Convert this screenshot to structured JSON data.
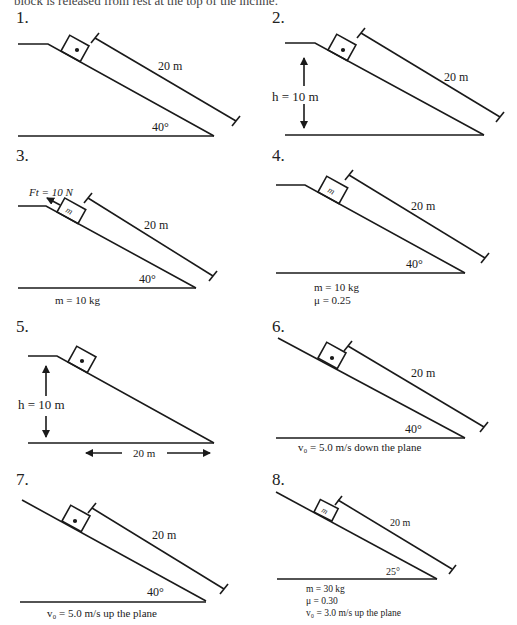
{
  "header": {
    "clipped_text": "block is released from rest at the top of the incline."
  },
  "problems": [
    {
      "number": "1.",
      "length_label": "20 m",
      "angle_label": "40°"
    },
    {
      "number": "2.",
      "length_label": "20 m",
      "height_label": "h = 10 m"
    },
    {
      "number": "3.",
      "length_label": "20 m",
      "angle_label": "40°",
      "force_label": "Ft = 10 N",
      "block_label": "m",
      "info": [
        "m = 10 kg"
      ]
    },
    {
      "number": "4.",
      "length_label": "20 m",
      "angle_label": "40°",
      "block_label": "m",
      "info": [
        "m = 10 kg",
        "μ = 0.25"
      ]
    },
    {
      "number": "5.",
      "height_label": "h = 10 m",
      "base_label": "20 m"
    },
    {
      "number": "6.",
      "length_label": "20 m",
      "angle_label": "40°",
      "info": [
        "v₀ = 5.0 m/s down the plane"
      ]
    },
    {
      "number": "7.",
      "length_label": "20 m",
      "angle_label": "40°",
      "info": [
        "v₀ = 5.0 m/s up the plane"
      ]
    },
    {
      "number": "8.",
      "length_label": "20 m",
      "angle_label": "25°",
      "block_label": "m",
      "info": [
        "m = 30 kg",
        "μ = 0.30",
        "v₀ = 3.0 m/s up the plane"
      ]
    }
  ]
}
